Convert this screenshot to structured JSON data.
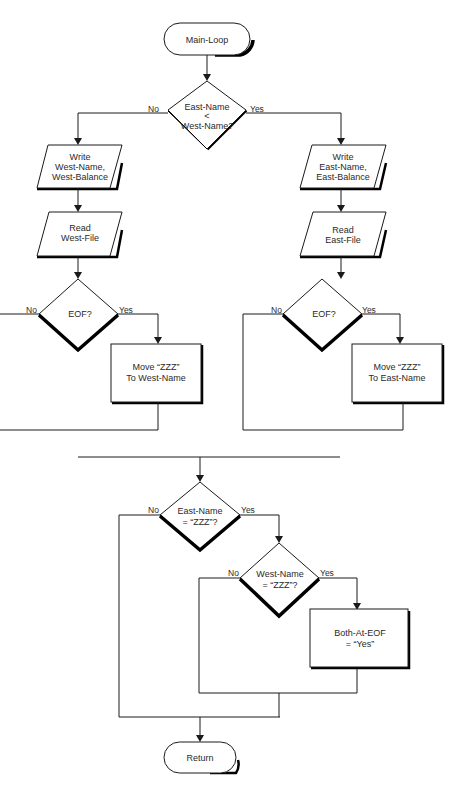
{
  "diagram": {
    "type": "flowchart",
    "colors": {
      "stroke": "#1a1a1a",
      "fill": "#ffffff",
      "text": "#2a2a2a"
    },
    "nodes": {
      "start": {
        "label": "Main-Loop",
        "shape": "terminator"
      },
      "cmp": {
        "line1": "East-Name",
        "line2": "<",
        "line3": "West-Name?",
        "shape": "decision"
      },
      "write_west": {
        "line1": "Write",
        "line2": "West-Name,",
        "line3": "West-Balance",
        "shape": "io"
      },
      "read_west": {
        "line1": "Read",
        "line2": "West-File",
        "shape": "io"
      },
      "eof_west": {
        "label": "EOF?",
        "shape": "decision"
      },
      "move_west": {
        "line1": "Move “ZZZ”",
        "line2": "To West-Name",
        "shape": "process"
      },
      "write_east": {
        "line1": "Write",
        "line2": "East-Name,",
        "line3": "East-Balance",
        "shape": "io"
      },
      "read_east": {
        "line1": "Read",
        "line2": "East-File",
        "shape": "io"
      },
      "eof_east": {
        "label": "EOF?",
        "shape": "decision"
      },
      "move_east": {
        "line1": "Move “ZZZ”",
        "line2": "To East-Name",
        "shape": "process"
      },
      "east_zzz": {
        "line1": "East-Name",
        "line2": "= “ZZZ”?",
        "shape": "decision"
      },
      "west_zzz": {
        "line1": "West-Name",
        "line2": "= “ZZZ”?",
        "shape": "decision"
      },
      "both_eof": {
        "line1": "Both-At-EOF",
        "line2": "= “Yes”",
        "shape": "process"
      },
      "end": {
        "label": "Return",
        "shape": "terminator"
      }
    },
    "edges": {
      "no": "No",
      "yes": "Yes"
    }
  }
}
